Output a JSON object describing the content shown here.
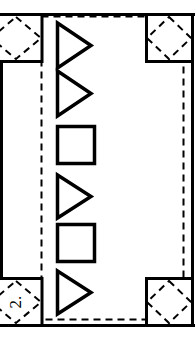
{
  "figure": {
    "name": "technical-line-drawing",
    "label": "2.",
    "label_rotation_deg": -90,
    "stroke_color": "#000000",
    "background_color": "#ffffff",
    "outer_frame": {
      "name": "outer-frame",
      "style": "solid",
      "x": 0,
      "y": 13,
      "width": 195,
      "height": 314,
      "stroke_width": 3
    },
    "inner_dashed_rect": {
      "name": "inner-dashed-rectangle",
      "style": "dashed",
      "x": 41,
      "y": 16,
      "width": 143,
      "height": 304,
      "stroke_width": 2,
      "dash_pattern": "7 5"
    },
    "corner_boxes": [
      {
        "name": "corner-box-top-left",
        "position": "top-left",
        "x": -8,
        "y": 13,
        "width": 50,
        "height": 49,
        "diamond_style": "dashed",
        "has_label": false
      },
      {
        "name": "corner-box-top-right",
        "position": "top-right",
        "x": 146,
        "y": 13,
        "width": 49,
        "height": 49,
        "diamond_style": "dashed",
        "has_label": false
      },
      {
        "name": "corner-box-bottom-left",
        "position": "bottom-left",
        "x": -8,
        "y": 271,
        "width": 50,
        "height": 49,
        "diamond_style": "dashed",
        "has_label": true,
        "label": "2."
      },
      {
        "name": "corner-box-bottom-right",
        "position": "bottom-right",
        "x": 146,
        "y": 271,
        "width": 49,
        "height": 49,
        "diamond_style": "dashed",
        "has_label": false
      }
    ],
    "shape_column": {
      "name": "shape-column",
      "count": 6,
      "sequence": [
        "triangle",
        "triangle",
        "square",
        "triangle",
        "square",
        "triangle"
      ],
      "orientation": "vertical",
      "triangle_direction": "right",
      "stroke_width": 3,
      "fill": "none",
      "shapes": [
        {
          "name": "shape-triangle-1",
          "type": "triangle",
          "index": 1,
          "x": 56,
          "y": 22,
          "width": 34,
          "height": 46
        },
        {
          "name": "shape-triangle-2",
          "type": "triangle",
          "index": 2,
          "x": 56,
          "y": 70,
          "width": 34,
          "height": 46
        },
        {
          "name": "shape-square-3",
          "type": "square",
          "index": 3,
          "x": 56,
          "y": 126,
          "width": 38,
          "height": 38
        },
        {
          "name": "shape-triangle-4",
          "type": "triangle",
          "index": 4,
          "x": 56,
          "y": 174,
          "width": 34,
          "height": 44
        },
        {
          "name": "shape-square-5",
          "type": "square",
          "index": 5,
          "x": 56,
          "y": 224,
          "width": 38,
          "height": 38
        },
        {
          "name": "shape-triangle-6",
          "type": "triangle",
          "index": 6,
          "x": 56,
          "y": 270,
          "width": 34,
          "height": 44
        }
      ]
    }
  }
}
